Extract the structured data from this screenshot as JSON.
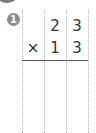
{
  "problem": {
    "number": "1",
    "top_row": [
      "",
      "2",
      "3"
    ],
    "bottom_row": [
      "×",
      "1",
      "3"
    ],
    "operator": "×"
  },
  "colors": {
    "badge": "#8c8c8c",
    "grid": "#b5b5b5",
    "text": "#333333"
  }
}
